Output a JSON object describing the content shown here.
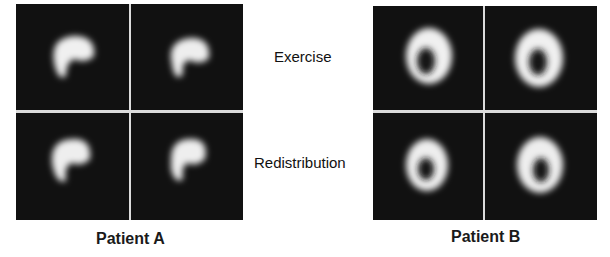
{
  "figure": {
    "row_labels": [
      "Exercise",
      "Redistribution"
    ],
    "patients": [
      {
        "label": "Patient A",
        "images": [
          {
            "row": "Exercise",
            "view": 1,
            "shape": "crescent"
          },
          {
            "row": "Exercise",
            "view": 2,
            "shape": "crescent-defect"
          },
          {
            "row": "Redistribution",
            "view": 1,
            "shape": "crescent"
          },
          {
            "row": "Redistribution",
            "view": 2,
            "shape": "crescent-defect"
          }
        ]
      },
      {
        "label": "Patient B",
        "images": [
          {
            "row": "Exercise",
            "view": 1,
            "shape": "ring"
          },
          {
            "row": "Exercise",
            "view": 2,
            "shape": "ring"
          },
          {
            "row": "Redistribution",
            "view": 1,
            "shape": "ring"
          },
          {
            "row": "Redistribution",
            "view": 2,
            "shape": "ring"
          }
        ]
      }
    ],
    "colors": {
      "background": "#ffffff",
      "panel": "#111111",
      "uptake": "#f2f2f2",
      "divider": "#dcdcdc"
    }
  }
}
